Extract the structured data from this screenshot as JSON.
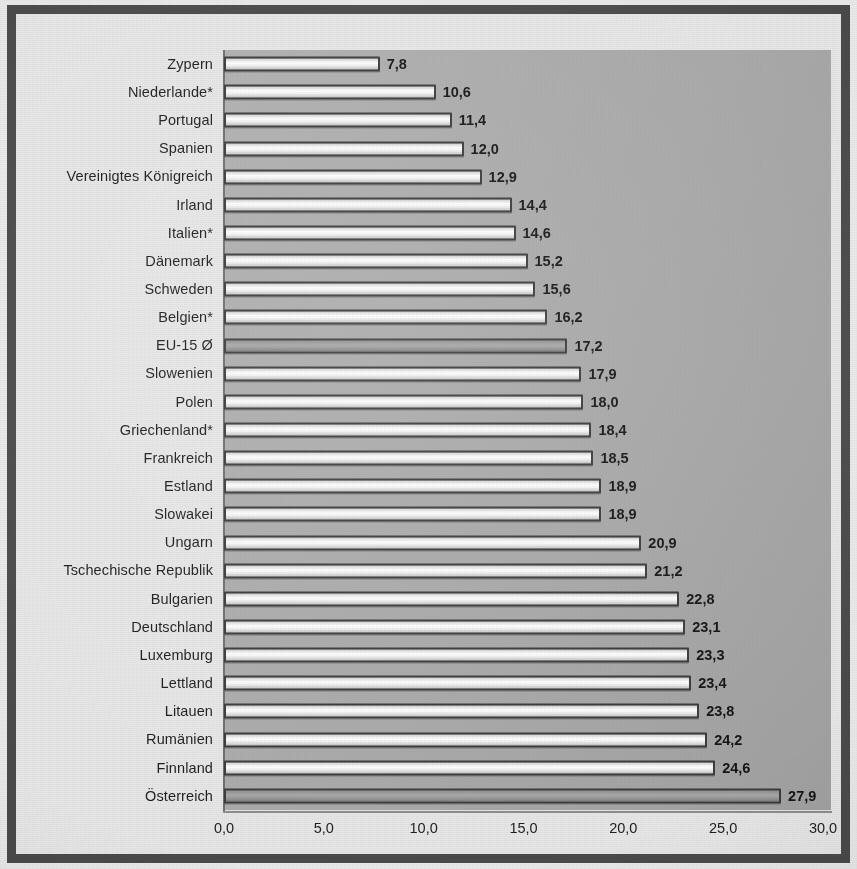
{
  "chart_data": {
    "type": "bar",
    "orientation": "horizontal",
    "title": "",
    "subtitle": "",
    "xlabel": "",
    "ylabel": "",
    "xlim": [
      0.0,
      30.0
    ],
    "xticks": [
      "0,0",
      "5,0",
      "10,0",
      "15,0",
      "20,0",
      "25,0",
      "30,0"
    ],
    "xtick_values": [
      0,
      5,
      10,
      15,
      20,
      25,
      30
    ],
    "xtick_step": 5.0,
    "grid": false,
    "legend": null,
    "decimal_separator": ",",
    "categories": [
      "Zypern",
      "Niederlande*",
      "Portugal",
      "Spanien",
      "Vereinigtes Königreich",
      "Irland",
      "Italien*",
      "Dänemark",
      "Schweden",
      "Belgien*",
      "EU-15 Ø",
      "Slowenien",
      "Polen",
      "Griechenland*",
      "Frankreich",
      "Estland",
      "Slowakei",
      "Ungarn",
      "Tschechische Republik",
      "Bulgarien",
      "Deutschland",
      "Luxemburg",
      "Lettland",
      "Litauen",
      "Rumänien",
      "Finnland",
      "Österreich"
    ],
    "values": [
      7.8,
      10.6,
      11.4,
      12.0,
      12.9,
      14.4,
      14.6,
      15.2,
      15.6,
      16.2,
      17.2,
      17.9,
      18.0,
      18.4,
      18.5,
      18.9,
      18.9,
      20.9,
      21.2,
      22.8,
      23.1,
      23.3,
      23.4,
      23.8,
      24.2,
      24.6,
      27.9
    ],
    "value_labels": [
      "7,8",
      "10,6",
      "11,4",
      "12,0",
      "12,9",
      "14,4",
      "14,6",
      "15,2",
      "15,6",
      "16,2",
      "17,2",
      "17,9",
      "18,0",
      "18,4",
      "18,5",
      "18,9",
      "18,9",
      "20,9",
      "21,2",
      "22,8",
      "23,1",
      "23,3",
      "23,4",
      "23,8",
      "24,2",
      "24,6",
      "27,9"
    ],
    "highlighted": [
      false,
      false,
      false,
      false,
      false,
      false,
      false,
      false,
      false,
      false,
      true,
      false,
      false,
      false,
      false,
      false,
      false,
      false,
      false,
      false,
      false,
      false,
      false,
      false,
      false,
      false,
      true
    ],
    "colors": {
      "plot_area_background": "#ababab",
      "figure_background": "#e6e6e6",
      "bar_fill": "#ffffff",
      "bar_fill_highlight": "#9d9d9d",
      "bar_border": "#3b3b3b",
      "text": "#1d1d1d",
      "frame": "#4a4a4a"
    }
  }
}
